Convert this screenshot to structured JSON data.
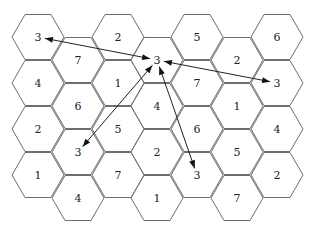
{
  "diagram": {
    "type": "hexagonal-cell-grid",
    "colors": {
      "cell_stroke": "#6e6e6e",
      "arrow": "#222222",
      "background": "#ffffff"
    },
    "geometry": {
      "radius": 26,
      "col_x": [
        38,
        78,
        118,
        157,
        197,
        237,
        277
      ],
      "even_row_y": [
        37,
        83,
        129,
        175
      ],
      "odd_row_y": [
        60,
        106,
        152,
        198
      ]
    },
    "columns": [
      {
        "index": 0,
        "labels": [
          "3",
          "4",
          "2",
          "1"
        ]
      },
      {
        "index": 1,
        "labels": [
          "7",
          "6",
          "3",
          "4"
        ]
      },
      {
        "index": 2,
        "labels": [
          "2",
          "1",
          "5",
          "7"
        ]
      },
      {
        "index": 3,
        "labels": [
          "3",
          "4",
          "2",
          "1"
        ]
      },
      {
        "index": 4,
        "labels": [
          "5",
          "7",
          "6",
          "3"
        ]
      },
      {
        "index": 5,
        "labels": [
          "2",
          "1",
          "5",
          "7"
        ]
      },
      {
        "index": 6,
        "labels": [
          "6",
          "3",
          "4",
          "2"
        ]
      }
    ],
    "arrows": [
      {
        "from": {
          "col": 3,
          "row": 0
        },
        "to": {
          "col": 0,
          "row": 0
        },
        "double_headed": true
      },
      {
        "from": {
          "col": 3,
          "row": 0
        },
        "to": {
          "col": 6,
          "row": 1
        },
        "double_headed": true
      },
      {
        "from": {
          "col": 3,
          "row": 0
        },
        "to": {
          "col": 1,
          "row": 2
        },
        "double_headed": true
      },
      {
        "from": {
          "col": 3,
          "row": 0
        },
        "to": {
          "col": 4,
          "row": 3
        },
        "double_headed": true
      }
    ]
  }
}
